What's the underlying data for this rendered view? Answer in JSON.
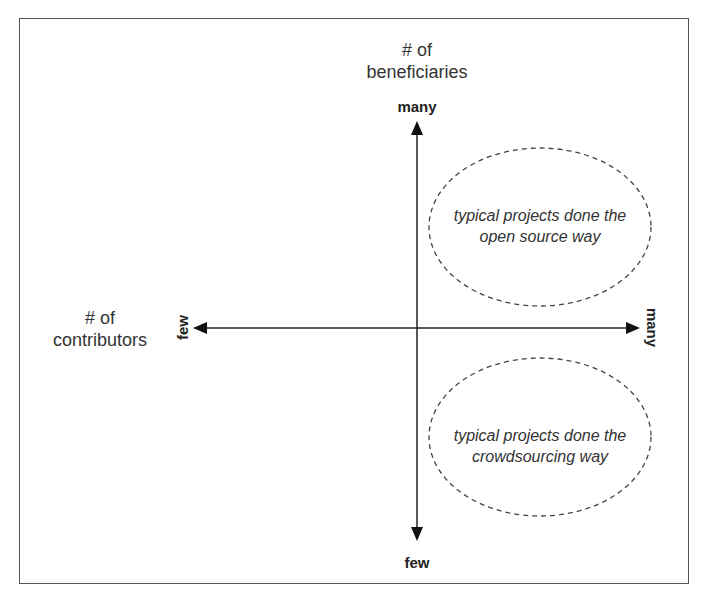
{
  "diagram": {
    "y_axis": {
      "title_line1": "# of",
      "title_line2": "beneficiaries",
      "top_label": "many",
      "bottom_label": "few"
    },
    "x_axis": {
      "title_line1": "# of",
      "title_line2": "contributors",
      "left_label": "few",
      "right_label": "many"
    },
    "regions": [
      {
        "line1": "typical projects done the",
        "line2": "open source way",
        "quadrant": "many contributors, many beneficiaries"
      },
      {
        "line1": "typical projects done the",
        "line2": "crowdsourcing way",
        "quadrant": "many contributors, few beneficiaries"
      }
    ],
    "colors": {
      "frame": "#555555",
      "axis": "#222222",
      "ellipse_dash": "#444444",
      "text": "#333333"
    }
  }
}
